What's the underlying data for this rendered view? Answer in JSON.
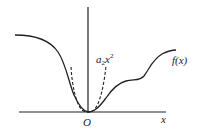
{
  "diagram": {
    "title": "",
    "labels": {
      "origin": "O",
      "x_axis": "x",
      "parabola": "a",
      "parabola_sub": "2",
      "parabola_var": "x",
      "parabola_exp": "2",
      "function": "f(x)"
    },
    "colors": {
      "ink": "#222222",
      "background": "#ffffff"
    },
    "elements": [
      {
        "type": "axis",
        "name": "x-axis"
      },
      {
        "type": "axis",
        "name": "y-axis"
      },
      {
        "type": "curve",
        "name": "f(x)",
        "style": "solid"
      },
      {
        "type": "curve",
        "name": "a2x^2",
        "style": "dashed"
      }
    ]
  }
}
